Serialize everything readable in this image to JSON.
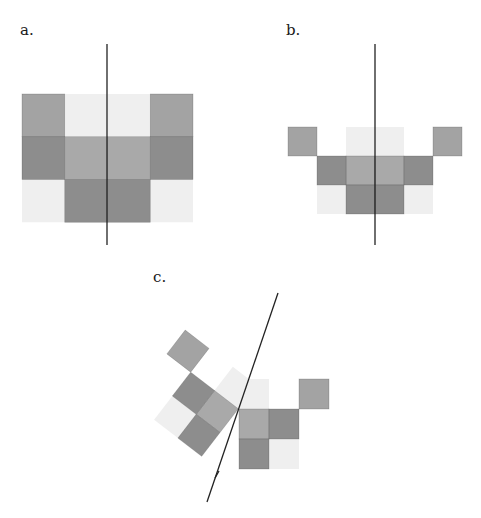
{
  "figure": {
    "panels": [
      {
        "id": "a",
        "label": "a.",
        "description": "Symmetric arrangement of shaded squares with a vertical axis of symmetry",
        "axis": "vertical",
        "grid": [
          [
            "mid",
            "light",
            "light",
            "mid"
          ],
          [
            "dark",
            "medium",
            "medium",
            "dark"
          ],
          [
            "light",
            "dark",
            "dark",
            "light"
          ]
        ]
      },
      {
        "id": "b",
        "label": "b.",
        "description": "Symmetric arrangement of shaded squares with a vertical axis of symmetry",
        "axis": "vertical",
        "grid": [
          [
            "mid",
            null,
            "light",
            "light",
            null,
            "mid"
          ],
          [
            null,
            "dark",
            "medium",
            "medium",
            "dark",
            null
          ],
          [
            null,
            "light",
            "dark",
            "dark",
            "light",
            null
          ]
        ]
      },
      {
        "id": "c",
        "label": "c.",
        "description": "Arrangement of squares reflected across an oblique line",
        "axis": "oblique",
        "half_grid": [
          [
            "light",
            null,
            "mid"
          ],
          [
            "medium",
            "dark",
            null
          ],
          [
            "dark",
            "light",
            null
          ]
        ]
      }
    ],
    "shades": {
      "light": "#efefef",
      "mid": "#a3a3a3",
      "medium": "#a9a9a9",
      "dark": "#8d8d8d"
    }
  }
}
